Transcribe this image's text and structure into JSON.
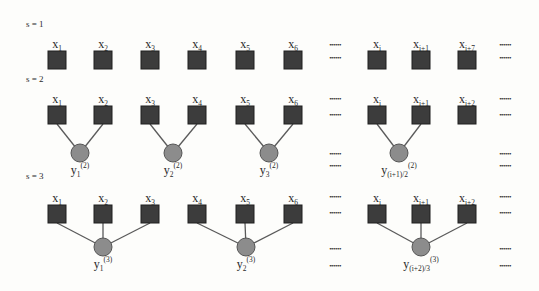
{
  "colors": {
    "square": "#3c3c3c",
    "square_stroke": "#1e1e1e",
    "circle": "#8c8c8c",
    "circle_stroke": "#555555",
    "edge": "#5a5a5a",
    "text": "#2a2a2a"
  },
  "ellipsis": "••••••",
  "rows": [
    {
      "scale_label": "s = 1",
      "label_y": 27,
      "square_y": 51,
      "nodes": [
        {
          "base": "x",
          "sub": "1",
          "cx": 57
        },
        {
          "base": "x",
          "sub": "2",
          "cx": 103
        },
        {
          "base": "x",
          "sub": "3",
          "cx": 150
        },
        {
          "base": "x",
          "sub": "4",
          "cx": 197
        },
        {
          "base": "x",
          "sub": "5",
          "cx": 245
        },
        {
          "base": "x",
          "sub": "6",
          "cx": 293
        },
        {
          "base": "x",
          "sub": "i",
          "cx": 377
        },
        {
          "base": "x",
          "sub": "i+1",
          "cx": 421
        },
        {
          "base": "x",
          "sub": "i+7",
          "cx": 467
        }
      ],
      "dots_top": [
        {
          "cx": 335,
          "y": 47
        },
        {
          "cx": 505,
          "y": 47
        }
      ],
      "dots_bottom": [
        {
          "cx": 335,
          "y": 60
        },
        {
          "cx": 505,
          "y": 60
        }
      ],
      "groups": []
    },
    {
      "scale_label": "s = 2",
      "label_y": 82,
      "square_y": 106,
      "nodes": [
        {
          "base": "x",
          "sub": "1",
          "cx": 57
        },
        {
          "base": "x",
          "sub": "2",
          "cx": 103
        },
        {
          "base": "x",
          "sub": "3",
          "cx": 150
        },
        {
          "base": "x",
          "sub": "4",
          "cx": 197
        },
        {
          "base": "x",
          "sub": "5",
          "cx": 245
        },
        {
          "base": "x",
          "sub": "6",
          "cx": 293
        },
        {
          "base": "x",
          "sub": "i",
          "cx": 377
        },
        {
          "base": "x",
          "sub": "i+1",
          "cx": 421
        },
        {
          "base": "x",
          "sub": "i+2",
          "cx": 467
        }
      ],
      "dots_top": [
        {
          "cx": 335,
          "y": 101
        },
        {
          "cx": 505,
          "y": 101
        }
      ],
      "dots_bottom": [
        {
          "cx": 335,
          "y": 117
        },
        {
          "cx": 505,
          "y": 117
        }
      ],
      "groups": [
        {
          "cx": 80,
          "cy": 153,
          "children": [
            0,
            1
          ],
          "base": "y",
          "sub": "1",
          "sup": "(2)"
        },
        {
          "cx": 173,
          "cy": 153,
          "children": [
            2,
            3
          ],
          "base": "y",
          "sub": "2",
          "sup": "(2)"
        },
        {
          "cx": 269,
          "cy": 153,
          "children": [
            4,
            5
          ],
          "base": "y",
          "sub": "3",
          "sup": "(2)"
        },
        {
          "cx": 399,
          "cy": 153,
          "children": [
            6,
            7
          ],
          "base": "y",
          "sub": "(i+1)/2",
          "sup": "(2)"
        }
      ],
      "dots_lower": [
        {
          "cx": 335,
          "y": 156
        },
        {
          "cx": 335,
          "y": 168
        },
        {
          "cx": 505,
          "y": 156
        },
        {
          "cx": 505,
          "y": 168
        }
      ]
    },
    {
      "scale_label": "s = 3",
      "label_y": 179,
      "square_y": 205,
      "nodes": [
        {
          "base": "x",
          "sub": "1",
          "cx": 57
        },
        {
          "base": "x",
          "sub": "2",
          "cx": 103
        },
        {
          "base": "x",
          "sub": "3",
          "cx": 150
        },
        {
          "base": "x",
          "sub": "4",
          "cx": 197
        },
        {
          "base": "x",
          "sub": "5",
          "cx": 245
        },
        {
          "base": "x",
          "sub": "6",
          "cx": 293
        },
        {
          "base": "x",
          "sub": "i",
          "cx": 377
        },
        {
          "base": "x",
          "sub": "i+1",
          "cx": 421
        },
        {
          "base": "x",
          "sub": "i+2",
          "cx": 467
        }
      ],
      "dots_top": [
        {
          "cx": 335,
          "y": 199
        },
        {
          "cx": 505,
          "y": 199
        }
      ],
      "dots_bottom": [
        {
          "cx": 335,
          "y": 215
        },
        {
          "cx": 505,
          "y": 215
        }
      ],
      "groups": [
        {
          "cx": 103,
          "cy": 247,
          "children": [
            0,
            1,
            2
          ],
          "base": "y",
          "sub": "1",
          "sup": "(3)"
        },
        {
          "cx": 246,
          "cy": 247,
          "children": [
            3,
            4,
            5
          ],
          "base": "y",
          "sub": "2",
          "sup": "(3)"
        },
        {
          "cx": 421,
          "cy": 247,
          "children": [
            6,
            7,
            8
          ],
          "base": "y",
          "sub": "(i+2)/3",
          "sup": "(3)"
        }
      ],
      "dots_lower": [
        {
          "cx": 335,
          "y": 251
        },
        {
          "cx": 335,
          "y": 268
        },
        {
          "cx": 505,
          "y": 251
        },
        {
          "cx": 505,
          "y": 268
        }
      ]
    }
  ]
}
